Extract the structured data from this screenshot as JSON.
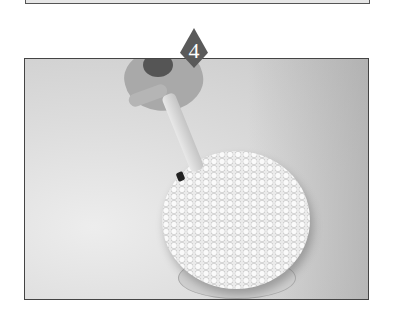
{
  "step": {
    "number": "4"
  },
  "photo": {
    "subject": "piping-frosting-basketweave-on-round-cake"
  },
  "colors": {
    "badge": "#5a5a5a",
    "frame": "#444444",
    "background": "#ffffff"
  }
}
